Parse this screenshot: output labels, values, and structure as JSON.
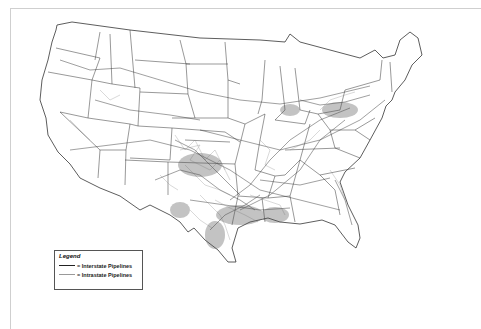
{
  "map": {
    "subject": "United States natural gas pipeline network",
    "colors": {
      "background": "#ffffff",
      "interstate": "#222222",
      "intrastate": "#999999",
      "state_border": "#333333",
      "frame": "#cfcfcf"
    }
  },
  "legend": {
    "title": "Legend",
    "items": [
      {
        "label": "= Interstate Pipelines",
        "style": "dark"
      },
      {
        "label": "= Intrastate Pipelines",
        "style": "light"
      }
    ]
  }
}
